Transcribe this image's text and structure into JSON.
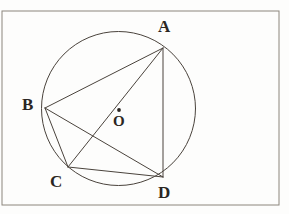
{
  "figure": {
    "type": "geometry-diagram",
    "canvas": {
      "width": 289,
      "height": 214
    },
    "colors": {
      "background": "#fdfdfc",
      "stroke": "#4a433c",
      "frame": "#8c867c",
      "label": "#2b2622"
    },
    "frame": {
      "name": "figure-border",
      "x": 2,
      "y": 11,
      "width": 277,
      "height": 194,
      "stroke_width": 1
    },
    "circle": {
      "name": "main-circle",
      "center_x": 118.5,
      "center_y": 108.5,
      "radius": 77,
      "stroke_width": 1
    },
    "center_point": {
      "name": "center-O",
      "x": 119,
      "y": 110,
      "dot_radius": 1.9,
      "label": "O",
      "label_x": 113,
      "label_y": 114
    },
    "points": [
      {
        "id": "A",
        "label": "A",
        "x": 163,
        "y": 48,
        "label_x": 158,
        "label_y": 18
      },
      {
        "id": "B",
        "label": "B",
        "x": 45,
        "y": 108,
        "label_x": 22,
        "label_y": 96
      },
      {
        "id": "C",
        "label": "C",
        "x": 68,
        "y": 167,
        "label_x": 50,
        "label_y": 173
      },
      {
        "id": "D",
        "label": "D",
        "x": 163,
        "y": 177,
        "label_x": 158,
        "label_y": 184
      }
    ],
    "chords": [
      {
        "name": "chord-AB",
        "from": "A",
        "to": "B"
      },
      {
        "name": "chord-AC",
        "from": "A",
        "to": "C"
      },
      {
        "name": "chord-AD",
        "from": "A",
        "to": "D"
      },
      {
        "name": "chord-BC",
        "from": "B",
        "to": "C"
      },
      {
        "name": "chord-BD",
        "from": "B",
        "to": "D"
      },
      {
        "name": "chord-CD",
        "from": "C",
        "to": "D"
      }
    ]
  }
}
